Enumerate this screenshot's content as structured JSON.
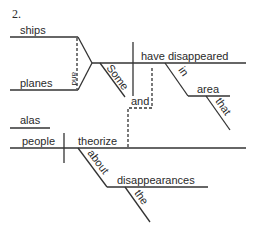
{
  "diagram": {
    "number": "2.",
    "words": {
      "ships": "ships",
      "planes": "planes",
      "conj_subjects": "and",
      "some": "Some",
      "have_disappeared": "have disappeared",
      "in": "in",
      "area": "area",
      "that": "that",
      "conj_clauses": "and",
      "alas": "alas",
      "people": "people",
      "theorize": "theorize",
      "about": "about",
      "disappearances": "disappearances",
      "the": "the"
    },
    "colors": {
      "ink": "#333333",
      "background": "#ffffff"
    }
  }
}
